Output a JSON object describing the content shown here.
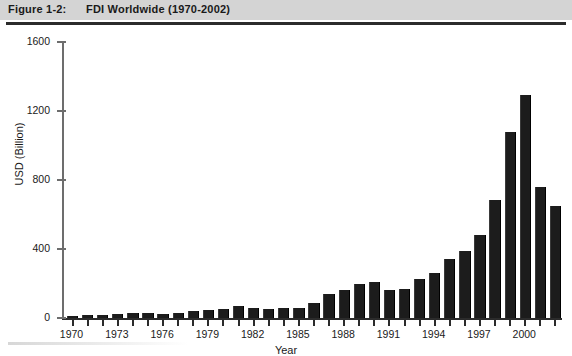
{
  "figure": {
    "label": "Figure 1-2:",
    "title": "FDI Worldwide (1970-2002)"
  },
  "chart_data": {
    "type": "bar",
    "title": "FDI Worldwide (1970-2002)",
    "xlabel": "Year",
    "ylabel": "USD (Billion)",
    "ylim": [
      0,
      1600
    ],
    "yticks": [
      0,
      400,
      800,
      1200,
      1600
    ],
    "xticks_labeled": [
      "1970",
      "1973",
      "1976",
      "1979",
      "1982",
      "1985",
      "1988",
      "1991",
      "1994",
      "1997",
      "2000"
    ],
    "grid": false,
    "legend": null,
    "bar_color": "#1c1c1c",
    "categories": [
      "1970",
      "1971",
      "1972",
      "1973",
      "1974",
      "1975",
      "1976",
      "1977",
      "1978",
      "1979",
      "1980",
      "1981",
      "1982",
      "1983",
      "1984",
      "1985",
      "1986",
      "1987",
      "1988",
      "1989",
      "1990",
      "1991",
      "1992",
      "1993",
      "1994",
      "1995",
      "1996",
      "1997",
      "1998",
      "1999",
      "2000",
      "2001",
      "2002"
    ],
    "values": [
      13,
      18,
      15,
      25,
      27,
      28,
      22,
      28,
      38,
      45,
      55,
      70,
      60,
      50,
      58,
      60,
      88,
      140,
      165,
      200,
      210,
      160,
      170,
      225,
      260,
      340,
      390,
      480,
      685,
      1080,
      1290,
      760,
      650
    ]
  }
}
